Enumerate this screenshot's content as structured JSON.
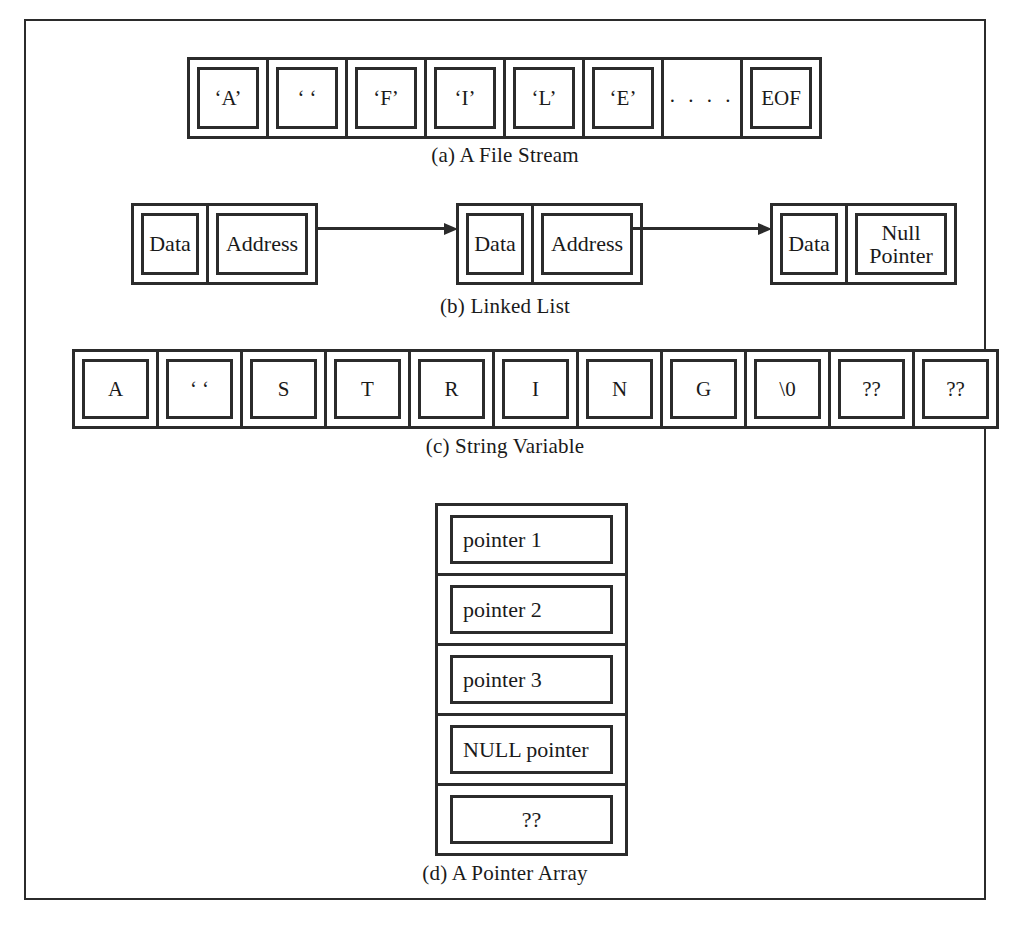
{
  "figure": {
    "panels": [
      {
        "id": "file-stream",
        "caption": "(a) A File Stream",
        "kind": "horizontal-cell-strip",
        "cells": [
          {
            "text": "‘A’",
            "has_inner_box": true
          },
          {
            "text": "‘ ‘",
            "has_inner_box": true
          },
          {
            "text": "‘F’",
            "has_inner_box": true
          },
          {
            "text": "‘I’",
            "has_inner_box": true
          },
          {
            "text": "‘L’",
            "has_inner_box": true
          },
          {
            "text": "‘E’",
            "has_inner_box": true
          },
          {
            "text": ". . . .",
            "has_inner_box": false
          },
          {
            "text": "EOF",
            "has_inner_box": true
          }
        ]
      },
      {
        "id": "linked-list",
        "caption": "(b) Linked List",
        "kind": "linked-list",
        "nodes": [
          {
            "data_label": "Data",
            "pointer_label": "Address",
            "has_outgoing_arrow": true
          },
          {
            "data_label": "Data",
            "pointer_label": "Address",
            "has_outgoing_arrow": true
          },
          {
            "data_label": "Data",
            "pointer_label": "Null\nPointer",
            "has_outgoing_arrow": false
          }
        ]
      },
      {
        "id": "string-variable",
        "caption": "(c) String Variable",
        "kind": "horizontal-cell-strip",
        "cells": [
          {
            "text": "A"
          },
          {
            "text": "‘ ‘"
          },
          {
            "text": "S"
          },
          {
            "text": "T"
          },
          {
            "text": "R"
          },
          {
            "text": "I"
          },
          {
            "text": "N"
          },
          {
            "text": "G"
          },
          {
            "text": "\\0"
          },
          {
            "text": "??"
          },
          {
            "text": "??"
          }
        ]
      },
      {
        "id": "pointer-array",
        "caption": "(d) A Pointer Array",
        "kind": "vertical-cell-stack",
        "cells": [
          {
            "text": "pointer 1",
            "align": "left"
          },
          {
            "text": "pointer 2",
            "align": "left"
          },
          {
            "text": "pointer 3",
            "align": "left"
          },
          {
            "text": "NULL pointer",
            "align": "left"
          },
          {
            "text": "??",
            "align": "center"
          }
        ]
      }
    ]
  },
  "colors": {
    "ink": "#2b2b2b",
    "paper": "#ffffff"
  }
}
